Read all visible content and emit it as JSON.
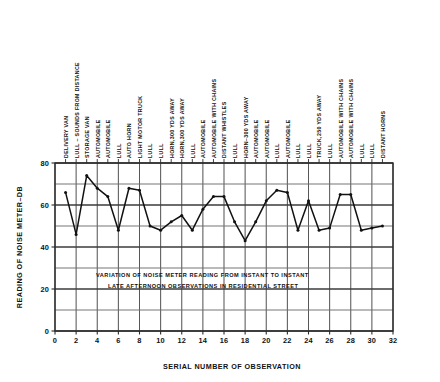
{
  "figure": {
    "background_color": "#ffffff",
    "ink_color": "#1a1a1a",
    "grid_color": "#585858",
    "frame_color": "#2b2b2b"
  },
  "chart_data": {
    "type": "line",
    "title": "",
    "xlabel": "SERIAL NUMBER OF OBSERVATION",
    "ylabel": "READING OF NOISE METER–DB",
    "xlim": [
      0,
      32
    ],
    "ylim": [
      0,
      80
    ],
    "xticks": [
      0,
      2,
      4,
      6,
      8,
      10,
      12,
      14,
      16,
      18,
      20,
      22,
      24,
      26,
      28,
      30,
      32
    ],
    "xticklabels": [
      "0",
      "2",
      "4",
      "6",
      "8",
      "10",
      "12",
      "14",
      "16",
      "18",
      "20",
      "22",
      "24",
      "26",
      "28",
      "30",
      "32"
    ],
    "yticks": [
      0,
      20,
      40,
      60,
      80
    ],
    "yticklabels": [
      "0",
      "20",
      "40",
      "60",
      "80"
    ],
    "grid": true,
    "grid_x_step": 2,
    "grid_y_step": 10,
    "legend": null,
    "marker": "dot",
    "x": [
      1,
      2,
      3,
      4,
      5,
      6,
      7,
      8,
      9,
      10,
      11,
      12,
      13,
      14,
      15,
      16,
      17,
      18,
      19,
      20,
      21,
      22,
      23,
      24,
      25,
      26,
      27,
      28,
      29,
      30,
      31
    ],
    "values": [
      66,
      46,
      74,
      68,
      64,
      48,
      68,
      67,
      50,
      48,
      52,
      55,
      48,
      58,
      64,
      64,
      52,
      43,
      52,
      62,
      67,
      66,
      48,
      62,
      48,
      49,
      65,
      65,
      48,
      49,
      50
    ],
    "annotations": [
      {
        "x": 1,
        "label": "DELIVERY VAN"
      },
      {
        "x": 2,
        "label": "LULL – SOUNDS FROM DISTANCE"
      },
      {
        "x": 3,
        "label": "STORAGE VAN"
      },
      {
        "x": 4,
        "label": "AUTOMOBILE"
      },
      {
        "x": 5,
        "label": "AUTOMOBILE"
      },
      {
        "x": 6,
        "label": "LULL"
      },
      {
        "x": 7,
        "label": "AUTO HORN"
      },
      {
        "x": 8,
        "label": "LIGHT MOTOR TRUCK"
      },
      {
        "x": 9,
        "label": "LULL"
      },
      {
        "x": 10,
        "label": "LULL"
      },
      {
        "x": 11,
        "label": "HORN,300 YDS AWAY"
      },
      {
        "x": 12,
        "label": "HORN,300 YDS AWAY"
      },
      {
        "x": 13,
        "label": "LULL"
      },
      {
        "x": 14,
        "label": "AUTOMOBILE"
      },
      {
        "x": 15,
        "label": "AUTOMOBILE WITH CHAINS"
      },
      {
        "x": 16,
        "label": "DISTANT WHISTLES"
      },
      {
        "x": 17,
        "label": "LULL"
      },
      {
        "x": 18,
        "label": "HORN–300 YDS AWAY"
      },
      {
        "x": 19,
        "label": "AUTOMOBILE"
      },
      {
        "x": 20,
        "label": "AUTOMOBILE"
      },
      {
        "x": 21,
        "label": "LULL"
      },
      {
        "x": 22,
        "label": "AUTOMOBILE"
      },
      {
        "x": 23,
        "label": "LULL"
      },
      {
        "x": 24,
        "label": "LULL"
      },
      {
        "x": 25,
        "label": "TRUCK,250 YDS AWAY"
      },
      {
        "x": 26,
        "label": "LULL"
      },
      {
        "x": 27,
        "label": "AUTOMOBILE WITH CHAINS"
      },
      {
        "x": 28,
        "label": "AUTOMOBILE WITH CHAINS"
      },
      {
        "x": 29,
        "label": "LULL"
      },
      {
        "x": 30,
        "label": "LULL"
      },
      {
        "x": 31,
        "label": "DISTANT HORNS"
      }
    ],
    "caption_lines": [
      "VARIATION OF NOISE METER READING FROM INSTANT TO INSTANT",
      "LATE AFTERNOON OBSERVATIONS IN RESIDENTIAL STREET"
    ]
  }
}
